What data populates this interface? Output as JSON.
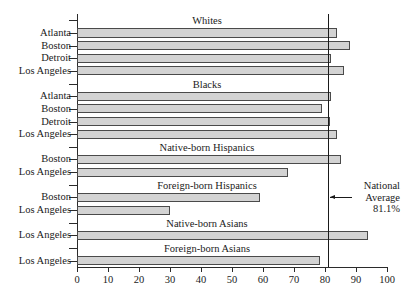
{
  "chart_data": {
    "type": "bar",
    "orientation": "horizontal",
    "title": "",
    "xlabel": "",
    "ylabel": "",
    "xlim": [
      0,
      100
    ],
    "xticks": [
      0,
      10,
      20,
      30,
      40,
      50,
      60,
      70,
      80,
      90,
      100
    ],
    "grid": false,
    "bar_color": "#d3d3d3",
    "bar_edge_color": "#4a4a4a",
    "legend": "none",
    "reference_line": {
      "value": 81.1,
      "label_line1": "National",
      "label_line2": "Average",
      "label_line3": "81.1%",
      "color": "#1a1a1a"
    },
    "groups": [
      {
        "name": "Whites",
        "categories": [
          "Atlanta",
          "Boston",
          "Detroit",
          "Los Angeles"
        ],
        "values": [
          84,
          88,
          82,
          86
        ]
      },
      {
        "name": "Blacks",
        "categories": [
          "Atlanta",
          "Boston",
          "Detroit",
          "Los Angeles"
        ],
        "values": [
          82,
          79,
          81.5,
          84
        ]
      },
      {
        "name": "Native-born Hispanics",
        "categories": [
          "Boston",
          "Los Angeles"
        ],
        "values": [
          85,
          68
        ]
      },
      {
        "name": "Foreign-born Hispanics",
        "categories": [
          "Boston",
          "Los Angeles"
        ],
        "values": [
          59,
          30
        ]
      },
      {
        "name": "Native-born Asians",
        "categories": [
          "Los Angeles"
        ],
        "values": [
          94
        ]
      },
      {
        "name": "Foreign-born Asians",
        "categories": [
          "Los Angeles"
        ],
        "values": [
          78.5
        ]
      }
    ]
  }
}
